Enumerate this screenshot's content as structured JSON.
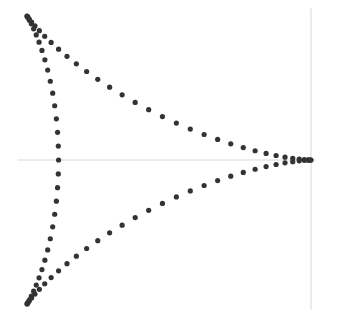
{
  "chart_data": {
    "type": "scatter",
    "title": "",
    "xlabel": "",
    "ylabel": "",
    "curve": "deltoid (3-cusp hypocycloid)",
    "equation": {
      "x": "2*cos(t) + cos(2*t)",
      "y": "2*sin(t) - sin(2*t)",
      "t_range": [
        0,
        6.283185
      ],
      "n_points": 100
    },
    "cusps": [
      [
        3,
        0
      ],
      [
        -1.5,
        2.598
      ],
      [
        -1.5,
        -2.598
      ]
    ],
    "xlim": [
      -1.95,
      3.45
    ],
    "ylim": [
      -2.8,
      2.8
    ],
    "axes": {
      "x_axis_line": {
        "y": 0,
        "x_from": -1.65,
        "x_to": 3.07
      },
      "y_axis_line": {
        "x": 3.0,
        "y_from": 2.74,
        "y_to": -2.7
      }
    },
    "grid": false,
    "legend": null,
    "marker_color": "#333333",
    "axis_color": "#d8d8d8",
    "marker_radius": 2.6
  }
}
